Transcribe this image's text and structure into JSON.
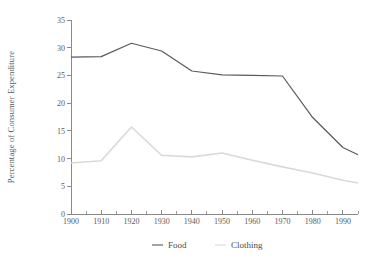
{
  "chart_data": {
    "type": "line",
    "title": "",
    "subtitle": "",
    "xlabel": "",
    "ylabel": "Percentage of Consumer Expenditure",
    "xlim": [
      1900,
      1995
    ],
    "ylim": [
      0,
      35
    ],
    "grid": false,
    "legend_position": "bottom",
    "x": [
      1900,
      1910,
      1920,
      1930,
      1940,
      1950,
      1960,
      1970,
      1980,
      1990,
      1995
    ],
    "xticks": [
      1900,
      1910,
      1920,
      1930,
      1940,
      1950,
      1960,
      1970,
      1980,
      1990
    ],
    "xtick_labels": [
      "1900",
      "1910",
      "1920",
      "1930",
      "1940",
      "1950",
      "1960",
      "1970",
      "1980",
      "1990"
    ],
    "xminor_ticks": [
      1905,
      1915,
      1925,
      1935,
      1945,
      1955,
      1965,
      1975,
      1985,
      1995
    ],
    "yticks": [
      0,
      5,
      10,
      15,
      20,
      25,
      30,
      35
    ],
    "ytick_labels": [
      "0",
      "5",
      "10",
      "15",
      "20",
      "25",
      "30",
      "35"
    ],
    "series": [
      {
        "name": "Food",
        "color": "#5a5a5a",
        "width": 1.2,
        "values": [
          28.3,
          28.4,
          30.8,
          29.4,
          25.8,
          25.1,
          25.0,
          24.9,
          17.4,
          12.0,
          10.7
        ]
      },
      {
        "name": "Clothing",
        "color": "#d9d9d9",
        "width": 1.6,
        "values": [
          9.2,
          9.6,
          15.7,
          10.6,
          10.3,
          11.0,
          9.7,
          8.5,
          7.4,
          6.1,
          5.6
        ]
      }
    ],
    "annotations": []
  },
  "legend": {
    "items": [
      {
        "label": "Food",
        "color": "#5a5a5a"
      },
      {
        "label": "Clothing",
        "color": "#d9d9d9"
      }
    ]
  },
  "axes": {
    "y_title": "Percentage of Consumer Expenditure"
  }
}
